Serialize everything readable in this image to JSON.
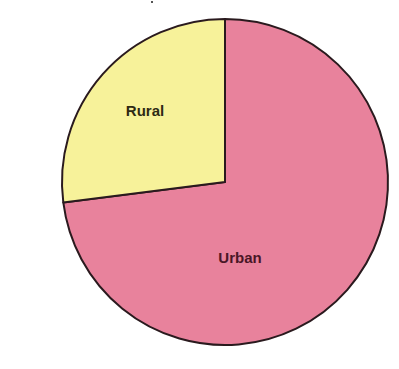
{
  "chart_data": {
    "type": "pie",
    "title": "",
    "categories": [
      "Rural",
      "Urban"
    ],
    "values": [
      27,
      73
    ],
    "unit": "%",
    "start_angle_deg": 90,
    "direction": "counterclockwise-from-top for Rural",
    "colors": {
      "Rural": "#F7F29A",
      "Urban": "#E8829C"
    },
    "label_colors": {
      "Rural": "#2E2A14",
      "Urban": "#4A1626"
    },
    "outline_color": "#2A1A1E",
    "legend": "none (labels drawn inside slices)"
  },
  "geometry": {
    "cx": 225,
    "cy": 182,
    "r": 163,
    "boundary_point": {
      "x": 62,
      "y": 200
    }
  },
  "labels": {
    "rural": {
      "text": "Rural",
      "x": 145,
      "y": 116
    },
    "urban": {
      "text": "Urban",
      "x": 240,
      "y": 263
    }
  }
}
